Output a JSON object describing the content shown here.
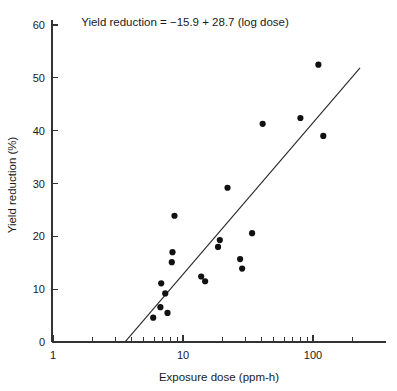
{
  "chart_data": {
    "type": "scatter",
    "title": "Yield reduction = −15.9 + 28.7 (log dose)",
    "xlabel": "Exposure dose (ppm-h)",
    "ylabel": "Yield reduction (%)",
    "xscale": "log",
    "yscale": "linear",
    "xlim": [
      1,
      250
    ],
    "ylim": [
      0,
      62
    ],
    "grid": false,
    "legend": "none",
    "x_tick_labels": [
      "1",
      "10",
      "100"
    ],
    "x_tick_values": [
      1,
      10,
      100
    ],
    "x_minor_ticks": [
      2,
      3,
      4,
      5,
      6,
      7,
      8,
      9,
      20,
      30,
      40,
      50,
      60,
      70,
      80,
      90,
      200
    ],
    "y_tick_labels": [
      "0",
      "10",
      "20",
      "30",
      "40",
      "50",
      "60"
    ],
    "y_tick_values": [
      0,
      10,
      20,
      30,
      40,
      50,
      60
    ],
    "points": [
      {
        "x": 5.9,
        "y": 4.6
      },
      {
        "x": 6.7,
        "y": 6.6
      },
      {
        "x": 6.8,
        "y": 11.1
      },
      {
        "x": 7.3,
        "y": 9.2
      },
      {
        "x": 7.6,
        "y": 5.5
      },
      {
        "x": 8.2,
        "y": 15.1
      },
      {
        "x": 8.3,
        "y": 17.0
      },
      {
        "x": 8.6,
        "y": 23.9
      },
      {
        "x": 13.8,
        "y": 12.4
      },
      {
        "x": 14.8,
        "y": 11.5
      },
      {
        "x": 18.6,
        "y": 18.0
      },
      {
        "x": 19.2,
        "y": 19.3
      },
      {
        "x": 22.0,
        "y": 29.2
      },
      {
        "x": 27.5,
        "y": 15.7
      },
      {
        "x": 28.5,
        "y": 13.9
      },
      {
        "x": 34.0,
        "y": 20.6
      },
      {
        "x": 41.0,
        "y": 41.3
      },
      {
        "x": 80.0,
        "y": 42.4
      },
      {
        "x": 110.0,
        "y": 52.5
      },
      {
        "x": 120.0,
        "y": 39.0
      }
    ],
    "fit": {
      "equation": "Yield reduction = −15.9 + 28.7 (log dose)",
      "intercept": -15.9,
      "slope": 28.7,
      "form": "y = intercept + slope * log10(x)",
      "x_start": 3.6,
      "x_end": 230
    }
  }
}
